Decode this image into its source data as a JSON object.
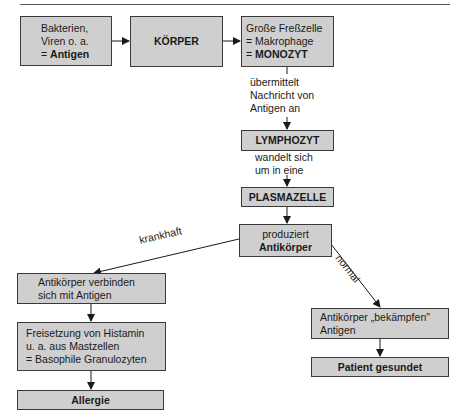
{
  "nodes": {
    "antigen": {
      "line1": "Bakterien,",
      "line2": "Viren o. a.",
      "line3_prefix": "= ",
      "line3_bold": "Antigen"
    },
    "koerper": {
      "label": "KÖRPER"
    },
    "monozyt": {
      "line1": "Große Freßzelle",
      "line2": "= Makrophage",
      "line3_prefix": "= ",
      "line3_bold": "MONOZYT"
    },
    "lymphozyt": {
      "label": "LYMPHOZYT"
    },
    "plasmazelle": {
      "label": "PLASMAZELLE"
    },
    "antikoerper": {
      "line1": "produziert",
      "line2_bold": "Antikörper"
    },
    "verbinden": {
      "line1": "Antikörper verbinden",
      "line2": "sich mit Antigen"
    },
    "histamin": {
      "line1": "Freisetzung von Histamin",
      "line2": "u. a. aus Mastzellen",
      "line3": "= Basophile Granulozyten"
    },
    "allergie": {
      "label": "Allergie"
    },
    "bekaempfen": {
      "line1": "Antikörper „bekämpfen\"",
      "line2": "Antigen"
    },
    "gesundet": {
      "label": "Patient gesundet"
    }
  },
  "edge_labels": {
    "monozyt_to_lymphozyt": {
      "line1": "übermittelt",
      "line2": "Nachricht von",
      "line3": "Antigen an"
    },
    "lymphozyt_to_plasmazelle": {
      "line1": "wandelt sich",
      "line2": "um in eine"
    },
    "krankhaft": "krankhaft",
    "normal": "normal"
  },
  "edges": [
    {
      "from": "antigen",
      "to": "koerper"
    },
    {
      "from": "koerper",
      "to": "monozyt"
    },
    {
      "from": "monozyt",
      "to": "lymphozyt",
      "label": "übermittelt Nachricht von Antigen an"
    },
    {
      "from": "lymphozyt",
      "to": "plasmazelle",
      "label": "wandelt sich um in eine"
    },
    {
      "from": "plasmazelle",
      "to": "antikoerper"
    },
    {
      "from": "antikoerper",
      "to": "verbinden",
      "label": "krankhaft"
    },
    {
      "from": "antikoerper",
      "to": "bekaempfen",
      "label": "normal"
    },
    {
      "from": "verbinden",
      "to": "histamin"
    },
    {
      "from": "histamin",
      "to": "allergie"
    },
    {
      "from": "bekaempfen",
      "to": "gesundet"
    }
  ],
  "colors": {
    "box_fill": "#cfcfcf",
    "box_border": "#3a3a3a",
    "line": "#1a1a1a"
  }
}
